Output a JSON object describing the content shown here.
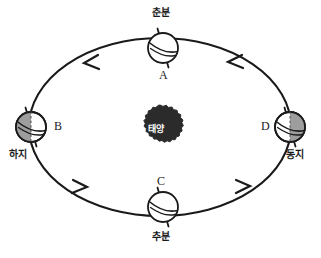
{
  "diagram": {
    "background_color": "#ffffff",
    "line_color": "#1a1a1a",
    "shade_color": "#9a9a9a",
    "sun": {
      "label": "태양",
      "name": "sun",
      "color": "#262626",
      "text_color": "#ffffff",
      "cx": 160,
      "cy": 127,
      "r": 20
    },
    "orbit": {
      "cx": 160,
      "cy": 127,
      "rx": 131,
      "ry": 89,
      "direction": "counterclockwise"
    },
    "arrows": [
      {
        "name": "arrow-upper-left",
        "x": 88,
        "y": 62,
        "angle": 196
      },
      {
        "name": "arrow-upper-right",
        "x": 234,
        "y": 62,
        "angle": 196
      },
      {
        "name": "arrow-lower-left",
        "x": 79,
        "y": 186,
        "angle": 20
      },
      {
        "name": "arrow-lower-right",
        "x": 245,
        "y": 186,
        "angle": 20
      }
    ],
    "positions": [
      {
        "id": "A",
        "name": "earth-position-a",
        "letter": "A",
        "season_label": "춘분",
        "season_label_position": "above",
        "cx": 163,
        "cy": 48,
        "r": 15,
        "shaded_side": "none",
        "axis_tilt_deg": 18,
        "letter_x": 159,
        "letter_y": 69,
        "season_x": 152,
        "season_y": 10
      },
      {
        "id": "B",
        "name": "earth-position-b",
        "letter": "B",
        "season_label": "하지",
        "season_label_position": "below-left",
        "cx": 31,
        "cy": 127,
        "r": 15,
        "shaded_side": "left",
        "axis_tilt_deg": 18,
        "letter_x": 54,
        "letter_y": 124,
        "season_x": 10,
        "season_y": 150
      },
      {
        "id": "C",
        "name": "earth-position-c",
        "letter": "C",
        "season_label": "추분",
        "season_label_position": "below",
        "cx": 163,
        "cy": 207,
        "r": 15,
        "shaded_side": "none",
        "axis_tilt_deg": 18,
        "letter_x": 157,
        "letter_y": 180,
        "season_x": 152,
        "season_y": 232
      },
      {
        "id": "D",
        "name": "earth-position-d",
        "letter": "D",
        "season_label": "동지",
        "season_label_position": "below-right",
        "cx": 290,
        "cy": 127,
        "r": 15,
        "shaded_side": "right",
        "axis_tilt_deg": 18,
        "letter_x": 262,
        "letter_y": 124,
        "season_x": 287,
        "season_y": 150
      }
    ]
  }
}
